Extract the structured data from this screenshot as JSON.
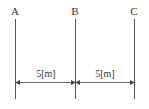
{
  "diagram": {
    "points": [
      {
        "label": "A",
        "x": 15
      },
      {
        "label": "B",
        "x": 75
      },
      {
        "label": "C",
        "x": 134
      }
    ],
    "dimensions": [
      {
        "label": "5[m]",
        "from": "A",
        "to": "B"
      },
      {
        "label": "5[m]",
        "from": "B",
        "to": "C"
      }
    ],
    "line_color": "#555555"
  }
}
